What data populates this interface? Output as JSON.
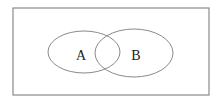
{
  "diagram": {
    "type": "venn",
    "universe": {
      "x": 13,
      "y": 8,
      "width": 196,
      "height": 87,
      "stroke": "#8a8a8a"
    },
    "sets": [
      {
        "label": "A",
        "cx": 84,
        "cy": 52,
        "rx": 36,
        "ry": 21,
        "label_x": 81,
        "label_y": 60
      },
      {
        "label": "B",
        "cx": 134,
        "cy": 53,
        "rx": 39,
        "ry": 24,
        "label_x": 136,
        "label_y": 60
      }
    ],
    "stroke_color": "#8a8a8a",
    "text_color": "#222222"
  }
}
